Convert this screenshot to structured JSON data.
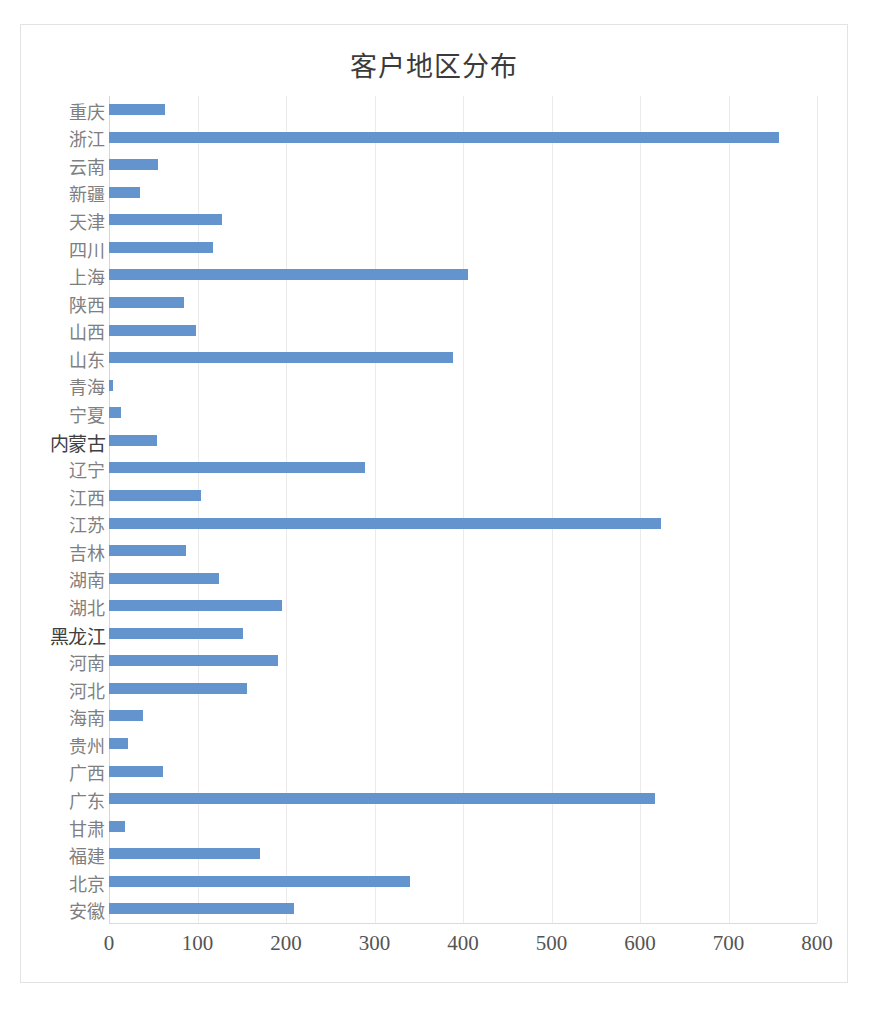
{
  "chart_data": {
    "type": "bar",
    "orientation": "horizontal",
    "title": "客户地区分布",
    "xlabel": "",
    "ylabel": "",
    "xlim": [
      0,
      800
    ],
    "xticks": [
      0,
      100,
      200,
      300,
      400,
      500,
      600,
      700,
      800
    ],
    "grid": "vertical",
    "legend": "none",
    "bar_color": "#6494ce",
    "categories": [
      "重庆",
      "浙江",
      "云南",
      "新疆",
      "天津",
      "四川",
      "上海",
      "陕西",
      "山西",
      "山东",
      "青海",
      "宁夏",
      "内蒙古",
      "辽宁",
      "江西",
      "江苏",
      "吉林",
      "湖南",
      "湖北",
      "黑龙江",
      "河南",
      "河北",
      "海南",
      "贵州",
      "广西",
      "广东",
      "甘肃",
      "福建",
      "北京",
      "安徽"
    ],
    "values": [
      63,
      757,
      55,
      35,
      128,
      117,
      406,
      85,
      98,
      389,
      4,
      13,
      54,
      289,
      104,
      624,
      87,
      124,
      195,
      151,
      191,
      156,
      38,
      21,
      61,
      617,
      18,
      171,
      340,
      209
    ]
  }
}
